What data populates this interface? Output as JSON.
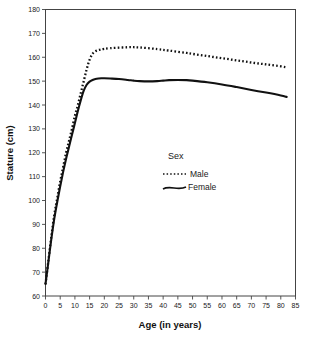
{
  "chart_data": {
    "type": "line",
    "title": "",
    "xlabel": "Age (in years)",
    "ylabel": "Stature (cm)",
    "xlim": [
      0,
      85
    ],
    "ylim": [
      60,
      180
    ],
    "xticks": [
      0,
      5,
      10,
      15,
      20,
      25,
      30,
      35,
      40,
      45,
      50,
      55,
      60,
      65,
      70,
      75,
      80,
      85
    ],
    "xtick_labels": [
      "0",
      "5",
      "10",
      "15",
      "20",
      "25",
      "30",
      "35",
      "40",
      "45",
      "50",
      "55",
      "60",
      "65",
      "70",
      "75",
      "80",
      "85"
    ],
    "yticks": [
      60,
      70,
      80,
      90,
      100,
      110,
      120,
      130,
      140,
      150,
      160,
      170,
      180
    ],
    "ytick_labels": [
      "60",
      "70",
      "80",
      "90",
      "100",
      "110",
      "120",
      "130",
      "140",
      "150",
      "160",
      "170",
      "180"
    ],
    "grid": false,
    "legend": {
      "title": "Sex",
      "position": "center",
      "entries": [
        {
          "name": "Male",
          "style": "dotted"
        },
        {
          "name": "Female",
          "style": "solid"
        }
      ]
    },
    "x": [
      0,
      1,
      2,
      3,
      4,
      5,
      6,
      7,
      8,
      9,
      10,
      11,
      12,
      13,
      14,
      15,
      16,
      17,
      18,
      19,
      20,
      22,
      25,
      28,
      30,
      32,
      35,
      38,
      40,
      42,
      45,
      48,
      50,
      55,
      60,
      65,
      70,
      75,
      80,
      82
    ],
    "series": [
      {
        "name": "Male",
        "style": "dotted",
        "values": [
          65.0,
          75.0,
          85.0,
          94.0,
          101.0,
          108.0,
          114.0,
          120.0,
          125.0,
          130.0,
          135.5,
          140.0,
          145.0,
          150.0,
          155.0,
          159.0,
          161.5,
          162.5,
          163.0,
          163.3,
          163.5,
          163.8,
          164.0,
          164.2,
          164.2,
          164.1,
          163.8,
          163.4,
          163.1,
          162.8,
          162.3,
          161.8,
          161.4,
          160.5,
          159.6,
          158.7,
          157.8,
          157.0,
          156.2,
          155.8
        ]
      },
      {
        "name": "Female",
        "style": "solid",
        "values": [
          65.0,
          74.5,
          84.0,
          92.5,
          99.5,
          106.0,
          112.0,
          117.5,
          122.5,
          127.5,
          132.5,
          137.5,
          142.0,
          146.0,
          148.5,
          149.8,
          150.5,
          150.9,
          151.1,
          151.2,
          151.2,
          151.1,
          150.9,
          150.5,
          150.2,
          150.0,
          149.9,
          150.0,
          150.2,
          150.4,
          150.5,
          150.4,
          150.2,
          149.5,
          148.6,
          147.5,
          146.3,
          145.2,
          144.0,
          143.4
        ]
      }
    ]
  }
}
